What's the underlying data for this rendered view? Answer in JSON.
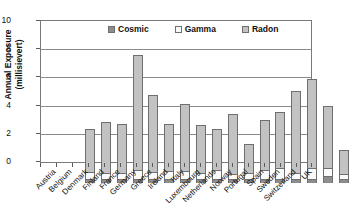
{
  "chart_data": {
    "type": "bar",
    "stacked": true,
    "title": "",
    "xlabel": "",
    "ylabel": "Annual Exposure\n(millisievert)",
    "ylim": [
      0,
      10
    ],
    "yticks": [
      0,
      2,
      4,
      6,
      8,
      10
    ],
    "grid": true,
    "legend_position": "top-inside",
    "categories": [
      "Austria",
      "Belgium",
      "Denmark",
      "Finland",
      "France",
      "Germany",
      "Greece",
      "Ireland",
      "Italy",
      "Luxembourg",
      "Netherlands",
      "Norway",
      "Portugal",
      "Spain",
      "Sweden",
      "Switzerland",
      "UK"
    ],
    "series": [
      {
        "name": "Cosmic",
        "color": "#8d8d8d",
        "values": [
          0.3,
          0.3,
          0.3,
          0.3,
          0.3,
          0.3,
          0.3,
          0.3,
          0.3,
          0.3,
          0.3,
          0.3,
          0.3,
          0.3,
          0.3,
          0.5,
          0.3
        ]
      },
      {
        "name": "Gamma",
        "color": "#fafafa",
        "values": [
          0.5,
          0.4,
          0.4,
          0.6,
          0.5,
          0.55,
          0.55,
          0.4,
          0.65,
          0.35,
          0.4,
          0.65,
          0.8,
          0.4,
          0.8,
          0.6,
          0.35
        ]
      },
      {
        "name": "Radon",
        "color": "#c2c2c2",
        "values": [
          3.0,
          3.65,
          3.5,
          8.2,
          5.45,
          3.35,
          4.75,
          3.4,
          2.85,
          4.25,
          2.05,
          3.55,
          3.95,
          5.8,
          6.3,
          4.35,
          1.7
        ]
      }
    ],
    "totals": [
      3.8,
      4.35,
      4.2,
      9.1,
      6.25,
      4.2,
      5.6,
      4.1,
      3.8,
      4.9,
      2.75,
      4.5,
      5.05,
      6.5,
      7.4,
      5.45,
      2.35
    ]
  },
  "legend": {
    "entries": [
      {
        "label": "Cosmic"
      },
      {
        "label": "Gamma"
      },
      {
        "label": "Radon"
      }
    ]
  }
}
